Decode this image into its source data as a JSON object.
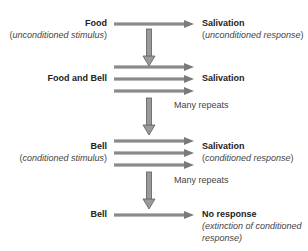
{
  "colors": {
    "arrow_fill": "#8a8a8a",
    "arrow_stroke": "#6a6a6a",
    "text": "#222222"
  },
  "stages": [
    {
      "stimulus": "Food",
      "stimulus_note_pre": "(",
      "stimulus_note": "unconditioned stimulus",
      "stimulus_note_post": ")",
      "response": "Salivation",
      "response_note_pre": "(",
      "response_note": "unconditioned response",
      "response_note_post": ")",
      "arrow_count": 1
    },
    {
      "stimulus": "Food and Bell",
      "response": "Salivation",
      "arrow_count": 3
    },
    {
      "stimulus": "Bell",
      "stimulus_note_pre": "(",
      "stimulus_note": "conditioned stimulus",
      "stimulus_note_post": ")",
      "response": "Salivation",
      "response_note_pre": "(",
      "response_note": "conditioned response",
      "response_note_post": ")",
      "arrow_count": 3
    },
    {
      "stimulus": "Bell",
      "response": "No response",
      "response_note_line1": "(extinction of conditioned",
      "response_note_line2": "response)",
      "arrow_count": 1
    }
  ],
  "transitions": [
    {
      "label": ""
    },
    {
      "label": "Many repeats"
    },
    {
      "label": "Many repeats"
    }
  ]
}
